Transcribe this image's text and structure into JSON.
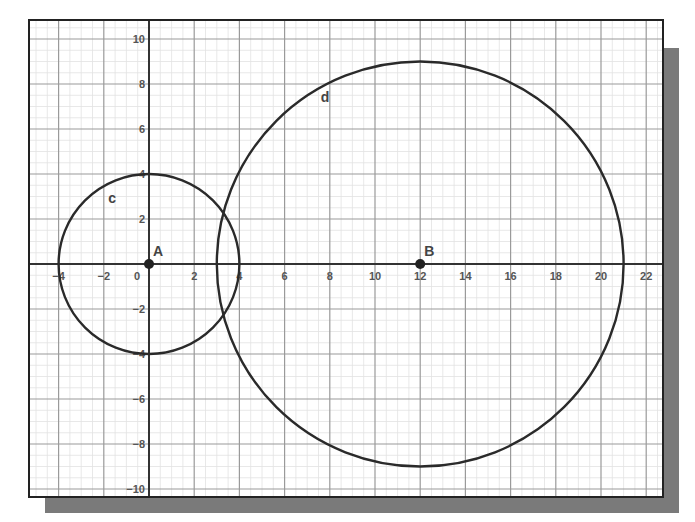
{
  "title": "",
  "colors": {
    "background": "#ffffff",
    "frame": "#222222",
    "shadow": "#7a7a7a",
    "major_grid": "#9a9a9a",
    "minor_grid": "#e2e2e2",
    "axis": "#333333",
    "curve": "#2a2a2a",
    "point": "#222222",
    "tick_label": "#555555"
  },
  "view": {
    "xmin": -5.35,
    "xmax": 22.7,
    "ymin": -10.35,
    "ymax": 10.85,
    "origin_px": [
      149,
      264
    ],
    "px_per_unit_x": 22.6,
    "px_per_unit_y": 22.5,
    "frame_px": {
      "left": 29,
      "top": 20,
      "right": 663,
      "bottom": 497
    },
    "shadow_offset_px": 16
  },
  "axes": {
    "x_ticks": [
      -4,
      -2,
      0,
      2,
      4,
      6,
      8,
      10,
      12,
      14,
      16,
      18,
      20,
      22
    ],
    "y_ticks": [
      -10,
      -8,
      -6,
      -4,
      -2,
      2,
      4,
      6,
      8,
      10
    ],
    "major_step": 2,
    "minor_step": 0.5
  },
  "points": [
    {
      "name": "A",
      "x": 0,
      "y": 0,
      "label": "A"
    },
    {
      "name": "B",
      "x": 12,
      "y": 0,
      "label": "B"
    }
  ],
  "circles": [
    {
      "name": "c",
      "center": "A",
      "cx": 0,
      "cy": 0,
      "r": 4,
      "label": "c",
      "label_pos": [
        -1.8,
        2.7
      ]
    },
    {
      "name": "d",
      "center": "B",
      "cx": 12,
      "cy": 0,
      "r": 9,
      "label": "d",
      "label_pos": [
        7.6,
        7.2
      ]
    }
  ],
  "chart_data": {
    "type": "scatter",
    "title": "",
    "xlabel": "",
    "ylabel": "",
    "xlim": [
      -5.35,
      22.7
    ],
    "ylim": [
      -10.35,
      10.85
    ],
    "grid": true,
    "x_tick_labels": [
      "-4",
      "-2",
      "0",
      "2",
      "4",
      "6",
      "8",
      "10",
      "12",
      "14",
      "16",
      "18",
      "20",
      "22"
    ],
    "y_tick_labels": [
      "10",
      "8",
      "6",
      "4",
      "2",
      "-2",
      "-4",
      "-6",
      "-8",
      "-10"
    ],
    "series": [
      {
        "name": "Points",
        "x": [
          0,
          12
        ],
        "y": [
          0,
          0
        ],
        "labels": [
          "A",
          "B"
        ]
      },
      {
        "name": "circle c",
        "shape": "circle",
        "center": [
          0,
          0
        ],
        "radius": 4
      },
      {
        "name": "circle d",
        "shape": "circle",
        "center": [
          12,
          0
        ],
        "radius": 9
      }
    ],
    "annotations": [
      "A",
      "B",
      "c",
      "d"
    ]
  }
}
